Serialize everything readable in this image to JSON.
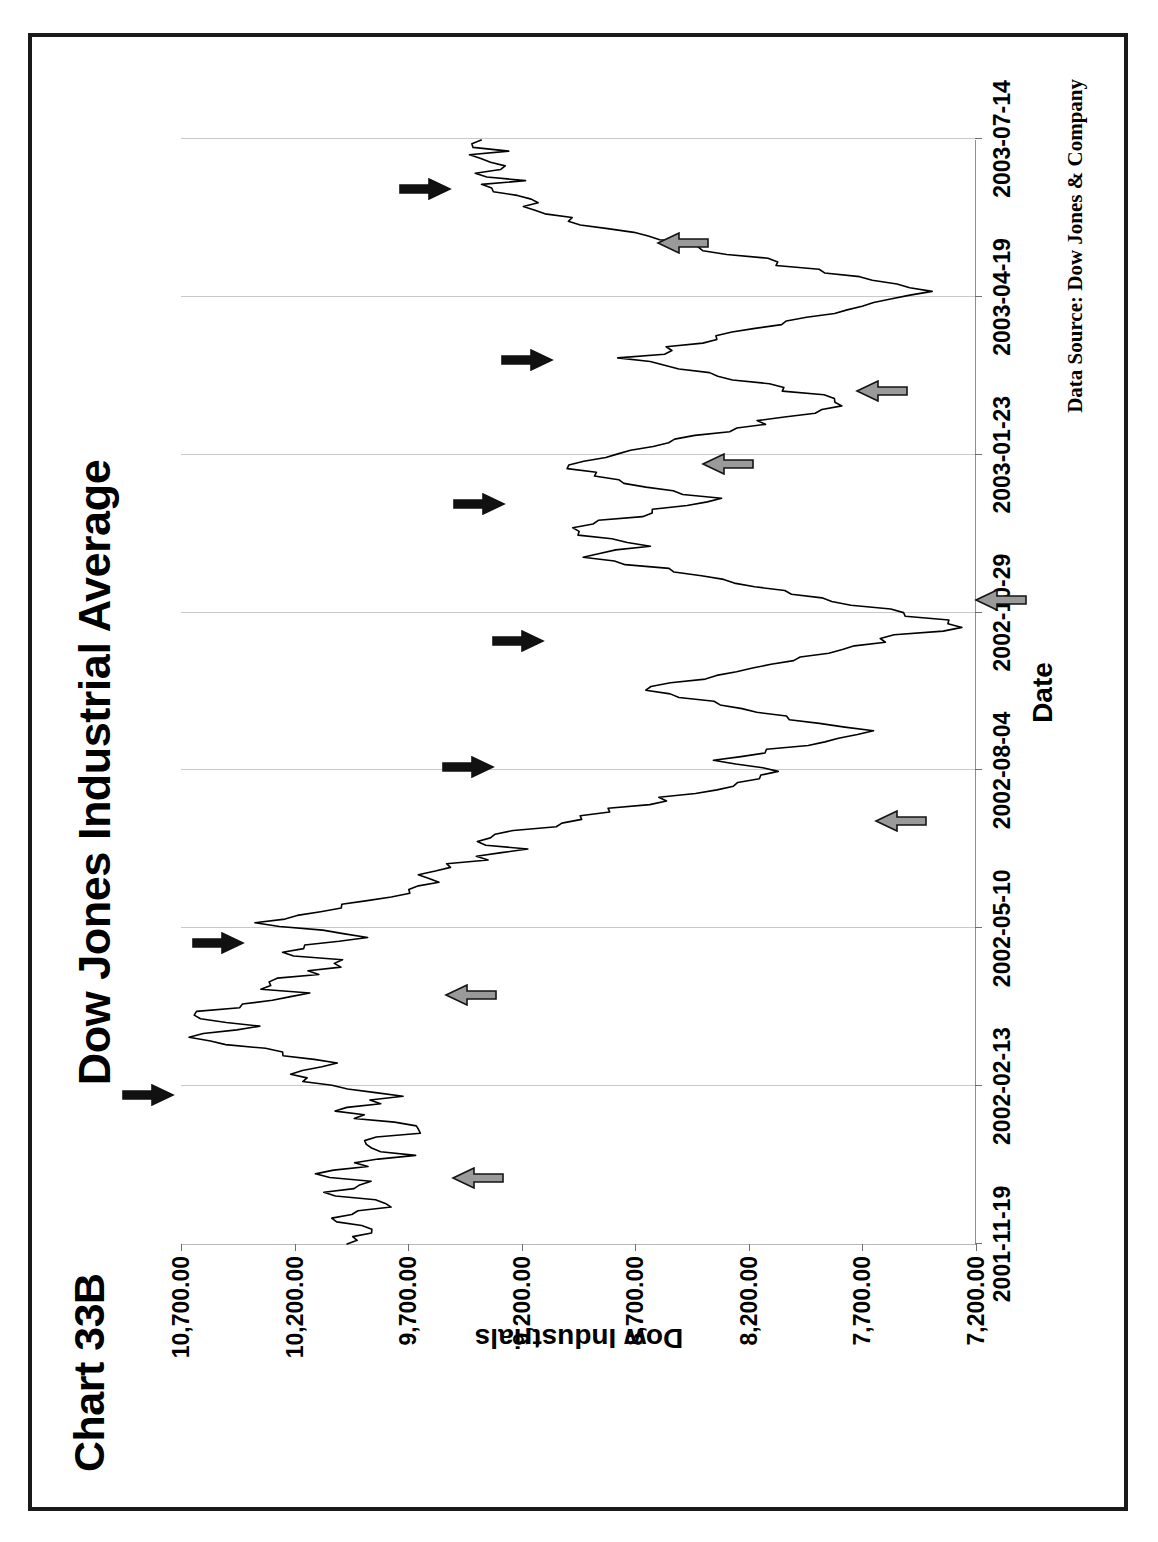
{
  "page": {
    "border_color": "#1a1a1a",
    "background": "#ffffff"
  },
  "chart_id": "Chart 33B",
  "source_note": "Data Source:  Dow Jones & Company",
  "chart_data": {
    "type": "line",
    "title": "Dow Jones Industrial Average",
    "xlabel": "Date",
    "ylabel": "Dow Industrials",
    "ylim": [
      7200,
      10700
    ],
    "yticks": [
      10700,
      10200,
      9700,
      9200,
      8700,
      8200,
      7700,
      7200
    ],
    "ytick_labels": [
      "10,700.00",
      "10,200.00",
      "9,700.00",
      "9,200.00",
      "8,700.00",
      "8,200.00",
      "7,700.00",
      "7,200.00"
    ],
    "xtick_labels": [
      "2001-11-19",
      "2002-02-13",
      "2002-05-10",
      "2002-08-04",
      "2002-10-29",
      "2003-01-23",
      "2003-04-19",
      "2003-07-14"
    ],
    "xtick_positions": [
      0,
      0.1429,
      0.2857,
      0.4286,
      0.5714,
      0.7143,
      0.8571,
      1.0
    ],
    "grid": "vertical-category-gridlines",
    "legend": "none",
    "line_color": "#000000",
    "x_start": "2001-11-19",
    "x_end": "2003-07-14",
    "series": [
      {
        "name": "Dow Industrials",
        "values": [
          9980,
          9920,
          10010,
          9890,
          9810,
          9890,
          9950,
          10020,
          9970,
          9890,
          9810,
          9760,
          9890,
          9970,
          10030,
          9940,
          9880,
          9920,
          10020,
          10100,
          10020,
          9950,
          9880,
          9790,
          9690,
          9760,
          9840,
          9930,
          9870,
          9790,
          9700,
          9630,
          9690,
          9790,
          9870,
          9950,
          10030,
          9960,
          9880,
          9810,
          9740,
          9820,
          9920,
          10010,
          10090,
          10180,
          10260,
          10180,
          10100,
          10030,
          10120,
          10210,
          10300,
          10400,
          10480,
          10560,
          10620,
          10560,
          10480,
          10400,
          10480,
          10560,
          10620,
          10560,
          10480,
          10400,
          10330,
          10260,
          10190,
          10280,
          10370,
          10300,
          10230,
          10160,
          10090,
          10020,
          9950,
          10040,
          10130,
          10220,
          10150,
          10080,
          10010,
          9940,
          10030,
          10120,
          10210,
          10300,
          10230,
          10160,
          10090,
          10020,
          9950,
          9880,
          9810,
          9740,
          9670,
          9600,
          9530,
          9620,
          9700,
          9630,
          9560,
          9490,
          9420,
          9350,
          9280,
          9210,
          9300,
          9390,
          9320,
          9250,
          9180,
          9110,
          9040,
          8970,
          8900,
          8830,
          8760,
          8690,
          8620,
          8550,
          8480,
          8410,
          8340,
          8270,
          8200,
          8130,
          8060,
          8150,
          8240,
          8330,
          8250,
          8170,
          8090,
          8010,
          7930,
          7850,
          7770,
          7690,
          7780,
          7870,
          7960,
          8050,
          8140,
          8230,
          8320,
          8420,
          8510,
          8600,
          8690,
          8610,
          8530,
          8450,
          8370,
          8290,
          8210,
          8130,
          8050,
          7970,
          7890,
          7810,
          7730,
          7650,
          7570,
          7490,
          7410,
          7330,
          7280,
          7360,
          7450,
          7540,
          7630,
          7720,
          7810,
          7900,
          7990,
          8080,
          8170,
          8260,
          8350,
          8440,
          8530,
          8620,
          8710,
          8800,
          8890,
          8820,
          8750,
          8680,
          8760,
          8840,
          8920,
          9000,
          8930,
          8860,
          8790,
          8720,
          8650,
          8580,
          8510,
          8440,
          8370,
          8450,
          8530,
          8610,
          8690,
          8770,
          8850,
          8930,
          9010,
          8940,
          8870,
          8800,
          8730,
          8660,
          8590,
          8520,
          8450,
          8380,
          8310,
          8240,
          8170,
          8100,
          8030,
          7960,
          7890,
          7820,
          7750,
          7830,
          7910,
          7990,
          8070,
          8150,
          8230,
          8310,
          8390,
          8470,
          8550,
          8630,
          8710,
          8640,
          8570,
          8500,
          8430,
          8360,
          8290,
          8220,
          8150,
          8080,
          8010,
          7940,
          7870,
          7800,
          7730,
          7660,
          7590,
          7520,
          7450,
          7530,
          7610,
          7690,
          7770,
          7850,
          7930,
          8010,
          8090,
          8170,
          8250,
          8330,
          8410,
          8490,
          8570,
          8650,
          8730,
          8810,
          8890,
          8970,
          9050,
          9130,
          9210,
          9140,
          9070,
          9150,
          9230,
          9310,
          9390,
          9320,
          9250,
          9330,
          9410,
          9340,
          9270,
          9350,
          9430,
          9360,
          9290,
          9370,
          9450,
          9380
        ]
      }
    ],
    "annotations": [
      {
        "name": "peak-marker-1",
        "style": "black",
        "direction": "down",
        "x": 0.135,
        "y": 10640,
        "note": "local high"
      },
      {
        "name": "trough-marker-1",
        "style": "gray",
        "direction": "up",
        "x": 0.06,
        "y": 9590,
        "note": "local low"
      },
      {
        "name": "peak-marker-2",
        "style": "black",
        "direction": "down",
        "x": 0.272,
        "y": 10330,
        "note": "local high"
      },
      {
        "name": "trough-marker-2",
        "style": "gray",
        "direction": "up",
        "x": 0.225,
        "y": 9620,
        "note": "local low"
      },
      {
        "name": "peak-marker-3",
        "style": "black",
        "direction": "down",
        "x": 0.432,
        "y": 9230,
        "note": "local high"
      },
      {
        "name": "trough-marker-3",
        "style": "gray",
        "direction": "up",
        "x": 0.383,
        "y": 7730,
        "note": "local low"
      },
      {
        "name": "peak-marker-4",
        "style": "black",
        "direction": "down",
        "x": 0.546,
        "y": 9010,
        "note": "local high"
      },
      {
        "name": "trough-marker-4",
        "style": "gray",
        "direction": "up",
        "x": 0.583,
        "y": 7290,
        "note": "local low"
      },
      {
        "name": "peak-marker-5",
        "style": "black",
        "direction": "down",
        "x": 0.67,
        "y": 9180,
        "note": "local high"
      },
      {
        "name": "trough-marker-5",
        "style": "gray",
        "direction": "up",
        "x": 0.706,
        "y": 8490,
        "note": "local low"
      },
      {
        "name": "peak-marker-6",
        "style": "black",
        "direction": "down",
        "x": 0.8,
        "y": 8970,
        "note": "local high"
      },
      {
        "name": "trough-marker-6",
        "style": "gray",
        "direction": "up",
        "x": 0.772,
        "y": 7810,
        "note": "local low"
      },
      {
        "name": "peak-marker-7",
        "style": "black",
        "direction": "down",
        "x": 0.955,
        "y": 9420,
        "note": "local high"
      },
      {
        "name": "trough-marker-7",
        "style": "gray",
        "direction": "up",
        "x": 0.906,
        "y": 8690,
        "note": "local low"
      }
    ],
    "arrow_colors": {
      "black": "#111111",
      "gray": "#9a9a9a",
      "gray_outline": "#141414"
    }
  }
}
